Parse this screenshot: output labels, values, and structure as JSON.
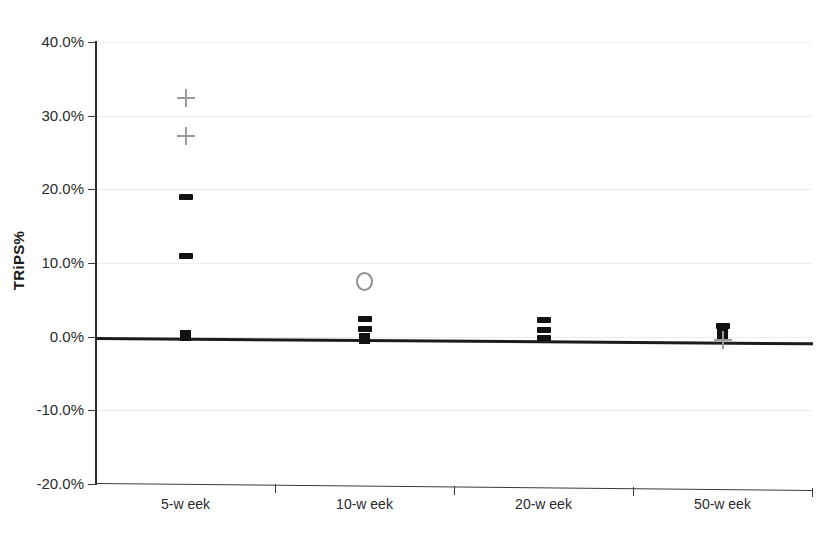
{
  "chart_data": {
    "type": "scatter",
    "title": "",
    "subtitle": "",
    "xlabel": "",
    "ylabel": "TRiPS%",
    "categories": [
      "5-w eek",
      "10-w eek",
      "20-w eek",
      "50-w eek"
    ],
    "ytick_labels": [
      "40.0%",
      "30.0%",
      "20.0%",
      "10.0%",
      "0.0%",
      "-10.0%",
      "-20.0%"
    ],
    "ytick_values": [
      40,
      30,
      20,
      10,
      0,
      -10,
      -20
    ],
    "ylim": [
      -20,
      40
    ],
    "yunit": "percent",
    "grid": true,
    "grid_axis": "y",
    "legend": "none",
    "legend_position": "none",
    "zero_reference_line": {
      "label": "",
      "values": [
        0.2,
        0.1,
        0.0,
        -0.2
      ],
      "color": "#1c1c1c",
      "style": "thick-solid"
    },
    "series": [
      {
        "name": "dash-series",
        "marker": "dash",
        "color": "#111111",
        "points": [
          {
            "category": "5-w eek",
            "value": 19.0
          },
          {
            "category": "5-w eek",
            "value": 11.0
          },
          {
            "category": "10-w eek",
            "value": 2.6
          },
          {
            "category": "10-w eek",
            "value": 1.3
          },
          {
            "category": "20-w eek",
            "value": 2.7
          },
          {
            "category": "20-w eek",
            "value": 1.3
          },
          {
            "category": "20-w eek",
            "value": 0.2
          },
          {
            "category": "50-w eek",
            "value": 2.1
          }
        ]
      },
      {
        "name": "square-series",
        "marker": "square",
        "color": "#111111",
        "points": [
          {
            "category": "5-w eek",
            "value": 0.2
          },
          {
            "category": "10-w eek",
            "value": 0.0
          },
          {
            "category": "50-w eek",
            "value": 1.1
          }
        ]
      },
      {
        "name": "plus-series",
        "marker": "plus",
        "color": "#9a9a9a",
        "points": [
          {
            "category": "5-w eek",
            "value": 32.5
          },
          {
            "category": "5-w eek",
            "value": 27.3
          },
          {
            "category": "50-w eek",
            "value": 0.2
          }
        ]
      },
      {
        "name": "circle-series",
        "marker": "open-circle",
        "color": "#8f8f8f",
        "points": [
          {
            "category": "10-w eek",
            "value": 7.8
          }
        ]
      }
    ]
  },
  "colors": {
    "axis": "#3a3a3a",
    "grid": "#ededed",
    "text": "#2b2b2b",
    "marker_dark": "#111111",
    "marker_gray": "#9a9a9a",
    "zero_line": "#1c1c1c"
  }
}
